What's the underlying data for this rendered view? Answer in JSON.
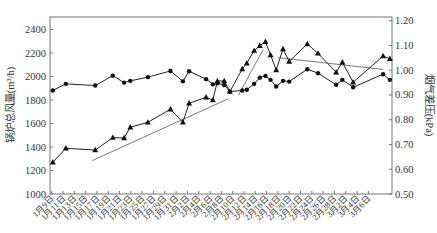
{
  "chart_data": {
    "type": "line",
    "title": "",
    "xlabel": "",
    "ylabel": "锅炉总风量(m³/h)",
    "y2label": "烟气差压(kPa)",
    "ylim": [
      1000,
      2400
    ],
    "y2lim": [
      0.5,
      1.2
    ],
    "yticks": [
      "1000",
      "1200",
      "1400",
      "1600",
      "1800",
      "2000",
      "2200",
      "2400"
    ],
    "y2ticks": [
      "0.50",
      "0.60",
      "0.70",
      "0.80",
      "0.90",
      "1.00",
      "1.10",
      "1.20"
    ],
    "x_tick_labels": [
      "1月9日",
      "1月11日",
      "1月13日",
      "1月15日",
      "1月17日",
      "1月19日",
      "1月21日",
      "1月23日",
      "1月25日",
      "1月27日",
      "1月29日",
      "1月31日",
      "2月2日",
      "2月4日",
      "2月6日",
      "2月8日",
      "2月10日",
      "2月12日",
      "2月14日",
      "2月16日",
      "2月18日",
      "2月20日",
      "2月22日",
      "2月24日",
      "2月26日",
      "2月28日",
      "3月2日",
      "3月4日",
      "3月6日"
    ],
    "grid": false,
    "legend": "none",
    "x_day_index": [
      0.2,
      2.5,
      7.7,
      10.8,
      12.8,
      13.9,
      17.0,
      21.0,
      23.2,
      24.3,
      27.3,
      28.5,
      29.3,
      30.5,
      31.5,
      33.7,
      34.5,
      35.8,
      36.8,
      37.8,
      38.7,
      39.7,
      40.9,
      42.0,
      45.2,
      47.1,
      50.3,
      51.4,
      53.3,
      58.6,
      59.8
    ],
    "series": [
      {
        "name": "锅炉总风量",
        "axis": "left",
        "marker": "triangle",
        "values": [
          1270,
          1389,
          1374,
          1480,
          1477,
          1568,
          1610,
          1721,
          1610,
          1772,
          1823,
          1800,
          1962,
          1962,
          1871,
          2064,
          2113,
          2220,
          2262,
          2296,
          2183,
          2055,
          2234,
          2128,
          2277,
          2197,
          2036,
          2121,
          1951,
          2174,
          2151
        ]
      },
      {
        "name": "烟气差压",
        "axis": "right",
        "marker": "circle",
        "values": [
          0.918,
          0.945,
          0.938,
          0.978,
          0.95,
          0.957,
          0.972,
          0.997,
          0.955,
          0.996,
          0.964,
          0.943,
          0.947,
          0.94,
          0.914,
          0.918,
          0.921,
          0.945,
          0.97,
          0.977,
          0.961,
          0.934,
          0.957,
          0.954,
          1.004,
          0.988,
          0.941,
          0.961,
          0.931,
          0.984,
          0.961
        ]
      }
    ],
    "trend_lines": [
      {
        "name": "trend-1",
        "from_day": 7.2,
        "from_value": 1285,
        "to_day": 31.2,
        "to_value": 1810,
        "axis": "left"
      },
      {
        "name": "trend-2",
        "from_day": 33.0,
        "from_value": 1840,
        "to_day": 37.4,
        "to_value": 2230,
        "axis": "left"
      },
      {
        "name": "trend-3",
        "from_day": 40.1,
        "from_value": 2160,
        "to_day": 58.6,
        "to_value": 2060,
        "axis": "left"
      }
    ]
  }
}
